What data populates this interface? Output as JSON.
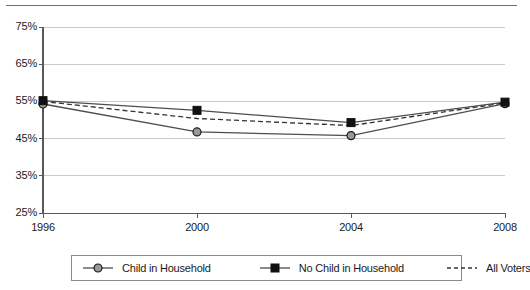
{
  "chart_data": {
    "type": "line",
    "title": "",
    "subtitle": "",
    "xlabel": "",
    "ylabel": "",
    "categories": [
      "1996",
      "2000",
      "2004",
      "2008"
    ],
    "x": [
      1996,
      2000,
      2004,
      2008
    ],
    "xlim": [
      1996,
      2008
    ],
    "ylim": [
      25,
      75
    ],
    "ytick_values": [
      75,
      65,
      55,
      45,
      35,
      25
    ],
    "ytick_labels": [
      "75%",
      "65%",
      "55%",
      "45%",
      "35%",
      "25%"
    ],
    "xtick_labels": [
      "1996",
      "2000",
      "2004",
      "2008"
    ],
    "grid": "horizontal",
    "legend_position": "bottom",
    "series": [
      {
        "name": "Child in Household",
        "values": [
          54.3,
          46.8,
          45.8,
          54.4
        ],
        "marker": "circle",
        "marker_fill": "#999999",
        "marker_edge": "#1a1a1a",
        "line_style": "solid",
        "line_color": "#4d4d4d"
      },
      {
        "name": "No Child in Household",
        "values": [
          55.2,
          52.6,
          49.3,
          54.8
        ],
        "marker": "square",
        "marker_fill": "#111111",
        "marker_edge": "#111111",
        "line_style": "solid",
        "line_color": "#4d4d4d"
      },
      {
        "name": "All Voters",
        "values": [
          55.0,
          50.4,
          48.5,
          54.6
        ],
        "marker": "none",
        "marker_fill": "none",
        "marker_edge": "none",
        "line_style": "dashed",
        "line_color": "#333333"
      }
    ]
  },
  "legend": {
    "entries": [
      {
        "label": "Child in Household",
        "marker": "circle-marker"
      },
      {
        "label": "No Child in Household",
        "marker": "square-marker"
      },
      {
        "label": "All Voters",
        "marker": "dashed-line"
      }
    ]
  },
  "colors": {
    "axis": "#595959",
    "gridline": "#c9c9c9",
    "text": "#1a1a1a",
    "legend_border": "#8a8a8a",
    "top_rule": "#6e6e6e",
    "background": "#ffffff"
  }
}
